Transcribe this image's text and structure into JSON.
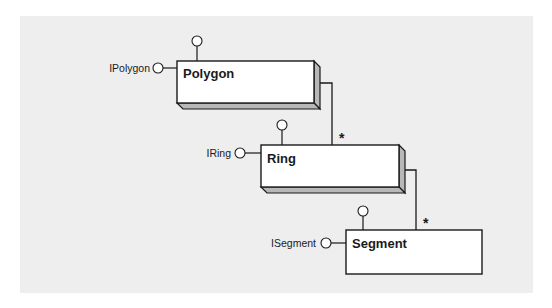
{
  "diagram": {
    "type": "UML class diagram",
    "classes": [
      {
        "name": "Polygon",
        "interface": "IPolygon",
        "style": "3d"
      },
      {
        "name": "Ring",
        "interface": "IRing",
        "style": "3d"
      },
      {
        "name": "Segment",
        "interface": "ISegment",
        "style": "flat"
      }
    ],
    "associations": [
      {
        "from": "Polygon",
        "to": "Ring",
        "multiplicity": "*"
      },
      {
        "from": "Ring",
        "to": "Segment",
        "multiplicity": "*"
      }
    ],
    "colors": {
      "background_panel": "#eeeeee",
      "box_fill": "#ffffff",
      "box_depth": "#b8b8b8",
      "stroke": "#1a1a1a"
    }
  }
}
